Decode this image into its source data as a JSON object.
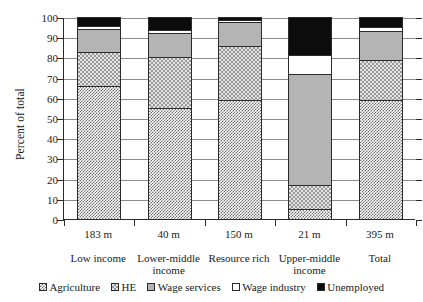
{
  "chart_data": {
    "type": "bar",
    "subtype": "stacked-bar-100",
    "title": "",
    "xlabel": "",
    "ylabel": "Percent of total",
    "ylim": [
      0,
      100
    ],
    "ytick_step": 10,
    "yticks": [
      "0",
      "10",
      "20",
      "30",
      "40",
      "50",
      "60",
      "70",
      "80",
      "90",
      "100"
    ],
    "grid": true,
    "legend_position": "bottom",
    "categories": [
      "Low income",
      "Lower-middle income",
      "Resource rich",
      "Upper-middle income",
      "Total"
    ],
    "category_sizes": [
      "183 m",
      "40 m",
      "150 m",
      "21 m",
      "395 m"
    ],
    "series": [
      {
        "name": "Agriculture",
        "values": [
          66.5,
          55.0,
          59.0,
          5.0,
          59.0
        ]
      },
      {
        "name": "HE",
        "values": [
          17.0,
          25.0,
          26.5,
          12.0,
          19.5
        ]
      },
      {
        "name": "Wage services",
        "values": [
          11.5,
          12.0,
          12.0,
          55.0,
          14.5
        ]
      },
      {
        "name": "Wage industry",
        "values": [
          1.5,
          1.5,
          1.0,
          9.0,
          2.0
        ]
      },
      {
        "name": "Unemployed",
        "values": [
          4.5,
          6.5,
          1.5,
          19.0,
          5.0
        ]
      }
    ],
    "colors": {
      "Agriculture": "#6e6e6e",
      "HE": "#e2e2e2",
      "Wage services": "#b4b4b4",
      "Wage industry": "#ffffff",
      "Unemployed": "#0c0c0c",
      "axis": "#2b2b2b",
      "gridline": "#8d8d8d"
    }
  }
}
